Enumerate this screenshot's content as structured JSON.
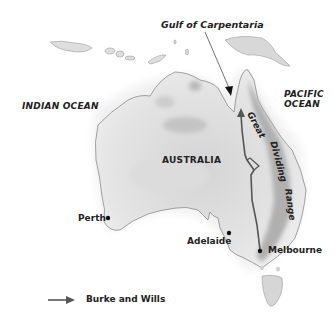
{
  "map": {
    "labels": {
      "gulf": "Gulf of Carpentaria",
      "indian_ocean": "INDIAN OCEAN",
      "pacific_ocean_line1": "PACIFIC",
      "pacific_ocean_line2": "OCEAN",
      "country": "AUSTRALIA",
      "range_word1": "Great",
      "range_word2": "Dividing",
      "range_word3": "Range"
    },
    "cities": [
      {
        "name": "Perth"
      },
      {
        "name": "Adelaide"
      },
      {
        "name": "Melbourne"
      }
    ],
    "legend": {
      "route_label": "Burke and Wills",
      "route_icon": "arrow-right-icon"
    },
    "colors": {
      "land": "#e6e6e6",
      "land_dark": "#b8b8b8",
      "coast": "#8a8a8a",
      "route": "#555555",
      "text": "#222222"
    }
  }
}
